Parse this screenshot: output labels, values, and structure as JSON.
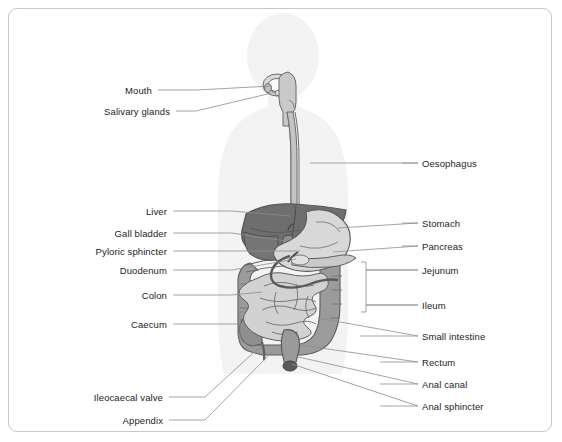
{
  "figure": {
    "frame": {
      "border_color": "#c9c9c9",
      "background": "#ffffff"
    },
    "palette": {
      "body_silhouette": "#f2f2f2",
      "liver_dark": "#6f6f6f",
      "liver_mid": "#8a8a8a",
      "stomach_light": "#d6d6d6",
      "colon_gray": "#9a9a9a",
      "small_intestine": "#cfcfcf",
      "oesophagus": "#bdbdbd",
      "outline": "#5a5a5a",
      "leader_line": "#8d8d8d",
      "text": "#1d1d1d"
    }
  },
  "labels_left": [
    {
      "id": "mouth",
      "text": "Mouth",
      "text_x": 152,
      "text_y": 85,
      "stub_x1": 158,
      "stub_x2": 196,
      "stub_y": 90,
      "target_x": 272,
      "target_y": 86
    },
    {
      "id": "salivary-glands",
      "text": "Salivary glands",
      "text_x": 170,
      "text_y": 106,
      "stub_x1": 176,
      "stub_x2": 196,
      "stub_y": 111,
      "target_x": 276,
      "target_y": 92
    },
    {
      "id": "liver",
      "text": "Liver",
      "text_x": 167,
      "text_y": 206,
      "stub_x1": 173,
      "stub_x2": 232,
      "stub_y": 211,
      "target_x": 290,
      "target_y": 216
    },
    {
      "id": "gall-bladder",
      "text": "Gall bladder",
      "text_x": 167,
      "text_y": 228,
      "stub_x1": 173,
      "stub_x2": 232,
      "stub_y": 233,
      "target_x": 286,
      "target_y": 241
    },
    {
      "id": "pyloric-sphincter",
      "text": "Pyloric sphincter",
      "text_x": 167,
      "text_y": 246,
      "stub_x1": 173,
      "stub_x2": 232,
      "stub_y": 251,
      "target_x": 300,
      "target_y": 251
    },
    {
      "id": "duodenum",
      "text": "Duodenum",
      "text_x": 167,
      "text_y": 265,
      "stub_x1": 173,
      "stub_x2": 232,
      "stub_y": 270,
      "target_x": 296,
      "target_y": 259
    },
    {
      "id": "colon",
      "text": "Colon",
      "text_x": 167,
      "text_y": 290,
      "stub_x1": 173,
      "stub_x2": 232,
      "stub_y": 295,
      "target_x": 262,
      "target_y": 292
    },
    {
      "id": "caecum",
      "text": "Caecum",
      "text_x": 167,
      "text_y": 319,
      "stub_x1": 173,
      "stub_x2": 240,
      "stub_y": 324,
      "target_x": 246,
      "target_y": 324
    },
    {
      "id": "ileocaecal-valve",
      "text": "Ileocaecal valve",
      "text_x": 163,
      "text_y": 392,
      "stub_x1": 169,
      "stub_x2": 205,
      "stub_y": 397,
      "target_x": 263,
      "target_y": 344
    },
    {
      "id": "appendix",
      "text": "Appendix",
      "text_x": 163,
      "text_y": 415,
      "stub_x1": 169,
      "stub_x2": 205,
      "stub_y": 420,
      "target_x": 272,
      "target_y": 352
    }
  ],
  "labels_right": [
    {
      "id": "oesophagus",
      "text": "Oesophagus",
      "text_x": 422,
      "text_y": 158,
      "stub_x1": 402,
      "stub_x2": 418,
      "stub_y": 163,
      "target_x": 310,
      "target_y": 163
    },
    {
      "id": "stomach",
      "text": "Stomach",
      "text_x": 422,
      "text_y": 218,
      "stub_x1": 402,
      "stub_x2": 418,
      "stub_y": 223,
      "target_x": 338,
      "target_y": 228
    },
    {
      "id": "pancreas",
      "text": "Pancreas",
      "text_x": 422,
      "text_y": 241,
      "stub_x1": 402,
      "stub_x2": 418,
      "stub_y": 246,
      "target_x": 333,
      "target_y": 252
    },
    {
      "id": "jejunum",
      "text": "Jejunum",
      "text_x": 422,
      "text_y": 265,
      "stub_x1": 366,
      "stub_x2": 418,
      "stub_y": 270,
      "target_x": 366,
      "target_y": 270
    },
    {
      "id": "ileum",
      "text": "Ileum",
      "text_x": 422,
      "text_y": 300,
      "stub_x1": 366,
      "stub_x2": 418,
      "stub_y": 305,
      "target_x": 366,
      "target_y": 305
    },
    {
      "id": "small-intestine",
      "text": "Small intestine",
      "text_x": 422,
      "text_y": 331,
      "stub_x1": 360,
      "stub_x2": 418,
      "stub_y": 336,
      "target_x": 318,
      "target_y": 318
    },
    {
      "id": "rectum",
      "text": "Rectum",
      "text_x": 422,
      "text_y": 357,
      "stub_x1": 380,
      "stub_x2": 418,
      "stub_y": 362,
      "target_x": 300,
      "target_y": 345
    },
    {
      "id": "anal-canal",
      "text": "Anal canal",
      "text_x": 422,
      "text_y": 379,
      "stub_x1": 380,
      "stub_x2": 418,
      "stub_y": 384,
      "target_x": 294,
      "target_y": 356
    },
    {
      "id": "anal-sphincter",
      "text": "Anal sphincter",
      "text_x": 422,
      "text_y": 401,
      "stub_x1": 380,
      "stub_x2": 418,
      "stub_y": 406,
      "target_x": 292,
      "target_y": 364
    }
  ],
  "brackets": [
    {
      "id": "caecum-bracket",
      "x": 240,
      "y_top": 312,
      "y_bottom": 338,
      "tick": 6
    },
    {
      "id": "jejunum-ileum-bracket",
      "x": 366,
      "y_top": 262,
      "y_bottom": 312,
      "tick": 5
    }
  ]
}
